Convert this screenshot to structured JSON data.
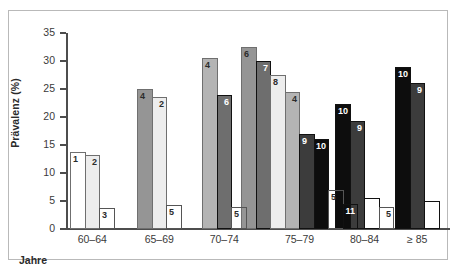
{
  "chart_data": {
    "type": "bar",
    "title": "",
    "xlabel": "Jahre",
    "ylabel": "Prävalenz (%)",
    "ylim": [
      0,
      35
    ],
    "yticks": [
      0,
      5,
      10,
      15,
      20,
      25,
      30,
      35
    ],
    "grid": false,
    "legend": "none",
    "categories": [
      "60–64",
      "65–69",
      "70–74",
      "75–79",
      "80–84",
      "≥ 85"
    ],
    "groups": [
      {
        "category": "60–64",
        "bars": [
          {
            "label": "1",
            "value": 13.8,
            "style": "white"
          },
          {
            "label": "2",
            "value": 13.3,
            "style": "very-light-gray"
          },
          {
            "label": "3",
            "value": 3.8,
            "style": "light-hatch"
          }
        ]
      },
      {
        "category": "65–69",
        "bars": [
          {
            "label": "4",
            "value": 25.0,
            "style": "medium-gray"
          },
          {
            "label": "2",
            "value": 23.5,
            "style": "very-light-gray"
          },
          {
            "label": "5",
            "value": 4.3,
            "style": "light-hatch"
          }
        ]
      },
      {
        "category": "70–74",
        "bars": [
          {
            "label": "4",
            "value": 30.5,
            "style": "light-medium-gray"
          },
          {
            "label": "6",
            "value": 24.0,
            "style": "dark-medium-gray"
          },
          {
            "label": "5",
            "value": 4.0,
            "style": "light-hatch"
          }
        ]
      },
      {
        "category": "75–79",
        "bars": [
          {
            "label": "6",
            "value": 32.5,
            "style": "medium-gray"
          },
          {
            "label": "7",
            "value": 30.0,
            "style": "dark-medium-gray"
          },
          {
            "label": "8",
            "value": 27.5,
            "style": "very-light-gray"
          },
          {
            "label": "4",
            "value": 24.5,
            "style": "light-medium-gray"
          },
          {
            "label": "9",
            "value": 17.0,
            "style": "charcoal"
          },
          {
            "label": "10",
            "value": 16.0,
            "style": "black"
          },
          {
            "label": "5",
            "value": 7.0,
            "style": "light-hatch"
          },
          {
            "label": "11",
            "value": 4.5,
            "style": "dark-hatch"
          }
        ]
      },
      {
        "category": "80–84",
        "bars": [
          {
            "label": "10",
            "value": 22.3,
            "style": "black"
          },
          {
            "label": "9",
            "value": 19.3,
            "style": "charcoal"
          },
          {
            "label": "11",
            "value": 5.5,
            "style": "dark-hatch"
          },
          {
            "label": "5",
            "value": 4.0,
            "style": "light-hatch"
          }
        ]
      },
      {
        "category": "≥ 85",
        "bars": [
          {
            "label": "10",
            "value": 29.0,
            "style": "black"
          },
          {
            "label": "9",
            "value": 26.0,
            "style": "charcoal"
          },
          {
            "label": "11",
            "value": 5.0,
            "style": "dark-hatch"
          }
        ]
      }
    ],
    "styles": {
      "white": "#ffffff",
      "very-light-gray": "#ededed",
      "light-medium-gray": "#b4b4b4",
      "medium-gray": "#959595",
      "dark-medium-gray": "#6e6e6e",
      "charcoal": "#3c3c3c",
      "black": "#0d0d0d",
      "light-hatch": "#c9c9c9",
      "dark-hatch": "#1a1a1a"
    }
  }
}
